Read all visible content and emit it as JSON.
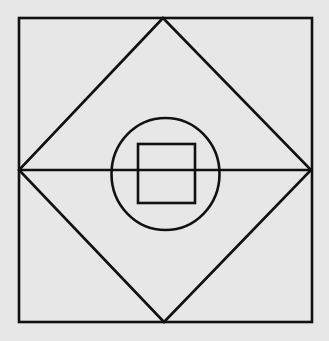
{
  "diagram": {
    "type": "geometric-figure",
    "canvas": {
      "width": 329,
      "height": 341,
      "background": "#e7e7e7"
    },
    "stroke": {
      "color": "#111111",
      "width": 2.6
    },
    "shapes": {
      "outer_square": {
        "x1": 19,
        "y1": 18,
        "x2": 312,
        "y2": 322
      },
      "diamond": {
        "top": [
          163,
          18
        ],
        "right": [
          311,
          170
        ],
        "bottom": [
          164,
          322
        ],
        "left": [
          19,
          170
        ]
      },
      "horizontal_diagonal": {
        "x1": 18,
        "y1": 170,
        "x2": 311,
        "y2": 170
      },
      "circle": {
        "cx": 165.5,
        "cy": 174,
        "rx": 54,
        "ry": 56
      },
      "inner_square": {
        "x1": 138,
        "y1": 144,
        "x2": 195,
        "y2": 203
      }
    },
    "labels": []
  }
}
